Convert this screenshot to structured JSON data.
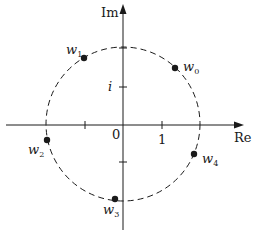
{
  "diagram": {
    "type": "complex-plane-roots",
    "axes": {
      "x_label": "Re",
      "y_label": "Im",
      "origin_label": "0",
      "x_tick_label": "1",
      "y_tick_label": "i"
    },
    "circle": {
      "style": "dashed",
      "radius_units": 2
    },
    "points": [
      {
        "name": "w",
        "sub": "0",
        "x": 175,
        "y": 68
      },
      {
        "name": "w",
        "sub": "1",
        "x": 84,
        "y": 58
      },
      {
        "name": "w",
        "sub": "2",
        "x": 47,
        "y": 140
      },
      {
        "name": "w",
        "sub": "3",
        "x": 115,
        "y": 199
      },
      {
        "name": "w",
        "sub": "4",
        "x": 194,
        "y": 154
      }
    ],
    "colors": {
      "ink": "#1a1a1a",
      "background": "#ffffff"
    }
  }
}
